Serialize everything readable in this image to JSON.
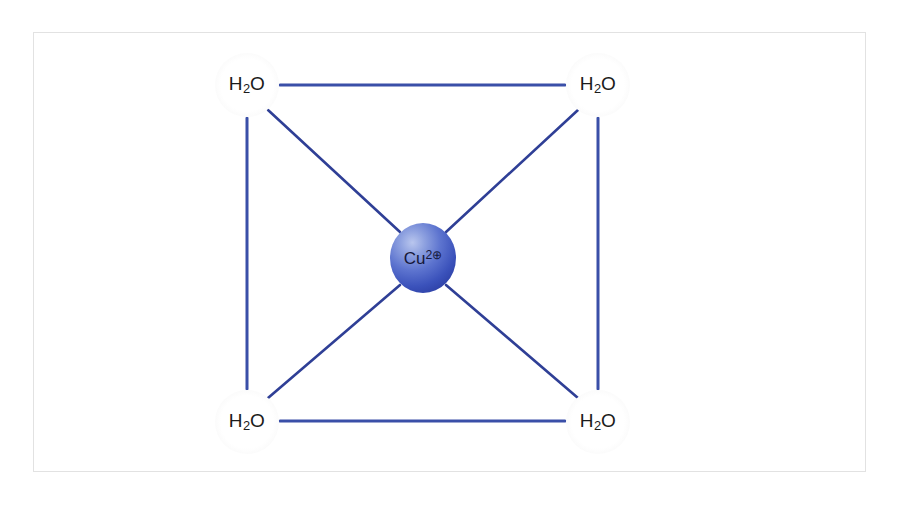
{
  "figure": {
    "frame_color": "#e2e2e2",
    "background_color": "#ffffff"
  },
  "diagram": {
    "type": "coordination-complex",
    "center": {
      "id": "cu-center",
      "symbol": "Cu",
      "charge_number": "2",
      "charge_glyph": "⊕",
      "full_label": "Cu2⊕",
      "x": 423,
      "y": 258,
      "radius_x": 33,
      "radius_y": 35,
      "fill_light": "#b9c6ee",
      "fill_mid": "#5d74cf",
      "fill_dark": "#26368f",
      "text_color": "#16183a"
    },
    "ligands": [
      {
        "id": "h2o-top-left",
        "formula_main": "H",
        "formula_sub": "2",
        "formula_tail": "O",
        "full_label": "H2O",
        "x": 247,
        "y": 85,
        "radius": 32
      },
      {
        "id": "h2o-top-right",
        "formula_main": "H",
        "formula_sub": "2",
        "formula_tail": "O",
        "full_label": "H2O",
        "x": 598,
        "y": 85,
        "radius": 32
      },
      {
        "id": "h2o-bottom-left",
        "formula_main": "H",
        "formula_sub": "2",
        "formula_tail": "O",
        "full_label": "H2O",
        "x": 247,
        "y": 422,
        "radius": 32
      },
      {
        "id": "h2o-bottom-right",
        "formula_main": "H",
        "formula_sub": "2",
        "formula_tail": "O",
        "full_label": "H2O",
        "x": 598,
        "y": 422,
        "radius": 32
      }
    ],
    "bonds": [
      {
        "id": "bond-top-edge",
        "from": "h2o-top-left",
        "to": "h2o-top-right",
        "kind": "edge",
        "x1": 280,
        "y1": 85,
        "x2": 565,
        "y2": 85,
        "width": 3,
        "color": "#3a4fa8"
      },
      {
        "id": "bond-bottom-edge",
        "from": "h2o-bottom-left",
        "to": "h2o-bottom-right",
        "kind": "edge",
        "x1": 280,
        "y1": 421,
        "x2": 565,
        "y2": 421,
        "width": 3,
        "color": "#3a4fa8"
      },
      {
        "id": "bond-left-edge",
        "from": "h2o-top-left",
        "to": "h2o-bottom-left",
        "kind": "edge",
        "x1": 247,
        "y1": 118,
        "x2": 247,
        "y2": 389,
        "width": 3,
        "color": "#3a4fa8"
      },
      {
        "id": "bond-right-edge",
        "from": "h2o-top-right",
        "to": "h2o-bottom-right",
        "kind": "edge",
        "x1": 598,
        "y1": 118,
        "x2": 598,
        "y2": 389,
        "width": 3,
        "color": "#3a4fa8"
      },
      {
        "id": "bond-center-top-left",
        "from": "cu-center",
        "to": "h2o-top-left",
        "kind": "coordinate",
        "x1": 400,
        "y1": 232,
        "x2": 268,
        "y2": 110,
        "width": 2.6,
        "color": "#2f3f96"
      },
      {
        "id": "bond-center-top-right",
        "from": "cu-center",
        "to": "h2o-top-right",
        "kind": "coordinate",
        "x1": 446,
        "y1": 232,
        "x2": 578,
        "y2": 110,
        "width": 2.6,
        "color": "#2f3f96"
      },
      {
        "id": "bond-center-bot-left",
        "from": "cu-center",
        "to": "h2o-bottom-left",
        "kind": "coordinate",
        "x1": 400,
        "y1": 285,
        "x2": 268,
        "y2": 398,
        "width": 2.6,
        "color": "#2f3f96"
      },
      {
        "id": "bond-center-bot-right",
        "from": "cu-center",
        "to": "h2o-bottom-right",
        "kind": "coordinate",
        "x1": 446,
        "y1": 285,
        "x2": 578,
        "y2": 398,
        "width": 2.6,
        "color": "#2f3f96"
      }
    ]
  }
}
